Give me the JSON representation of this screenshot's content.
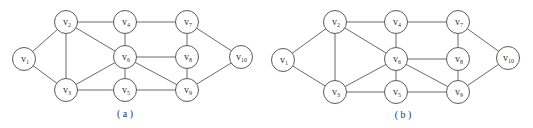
{
  "graphs": [
    {
      "id": "a",
      "caption": "( a )",
      "caption_pos": [
        125,
        117
      ],
      "nodes": [
        {
          "id": "v1",
          "main": "v",
          "sub": "1",
          "x": 24,
          "y": 59
        },
        {
          "id": "v2",
          "main": "v",
          "sub": "2",
          "x": 66,
          "y": 22
        },
        {
          "id": "v3",
          "main": "v",
          "sub": "3",
          "x": 66,
          "y": 90
        },
        {
          "id": "v4",
          "main": "v",
          "sub": "4",
          "x": 125,
          "y": 22
        },
        {
          "id": "v5",
          "main": "v",
          "sub": "5",
          "x": 125,
          "y": 90
        },
        {
          "id": "v6",
          "main": "v",
          "sub": "6",
          "x": 125,
          "y": 57
        },
        {
          "id": "v7",
          "main": "v",
          "sub": "7",
          "x": 187,
          "y": 22
        },
        {
          "id": "v8",
          "main": "v",
          "sub": "8",
          "x": 187,
          "y": 57
        },
        {
          "id": "v9",
          "main": "v",
          "sub": "9",
          "x": 187,
          "y": 90
        },
        {
          "id": "v10",
          "main": "v",
          "sub": "10",
          "x": 241,
          "y": 57
        }
      ]
    },
    {
      "id": "b",
      "caption": "( b )",
      "caption_pos": [
        403,
        118
      ],
      "nodes": [
        {
          "id": "v1",
          "main": "v",
          "sub": "1",
          "x": 283,
          "y": 60
        },
        {
          "id": "v2",
          "main": "v",
          "sub": "2",
          "x": 335,
          "y": 22
        },
        {
          "id": "v3",
          "main": "v",
          "sub": "3",
          "x": 335,
          "y": 92
        },
        {
          "id": "v4",
          "main": "v",
          "sub": "4",
          "x": 396,
          "y": 22
        },
        {
          "id": "v5",
          "main": "v",
          "sub": "5",
          "x": 396,
          "y": 92
        },
        {
          "id": "v6",
          "main": "v",
          "sub": "6",
          "x": 396,
          "y": 59
        },
        {
          "id": "v7",
          "main": "v",
          "sub": "7",
          "x": 458,
          "y": 22
        },
        {
          "id": "v8",
          "main": "v",
          "sub": "8",
          "x": 458,
          "y": 59
        },
        {
          "id": "v9",
          "main": "v",
          "sub": "9",
          "x": 458,
          "y": 92
        },
        {
          "id": "v10",
          "main": "v",
          "sub": "10",
          "x": 508,
          "y": 58
        }
      ]
    }
  ],
  "edges": [
    [
      "v1",
      "v2"
    ],
    [
      "v1",
      "v3"
    ],
    [
      "v2",
      "v3"
    ],
    [
      "v2",
      "v4"
    ],
    [
      "v2",
      "v6"
    ],
    [
      "v3",
      "v6"
    ],
    [
      "v3",
      "v5"
    ],
    [
      "v4",
      "v6"
    ],
    [
      "v6",
      "v5"
    ],
    [
      "v4",
      "v7"
    ],
    [
      "v6",
      "v8"
    ],
    [
      "v6",
      "v9"
    ],
    [
      "v5",
      "v9"
    ],
    [
      "v7",
      "v8"
    ],
    [
      "v8",
      "v9"
    ],
    [
      "v7",
      "v10"
    ],
    [
      "v9",
      "v10"
    ]
  ],
  "node_radius": 11.5,
  "colors": {
    "stroke": "#5a5a5a",
    "edge": "#6a6a6a",
    "text": "#333333",
    "background": "#ffffff"
  }
}
